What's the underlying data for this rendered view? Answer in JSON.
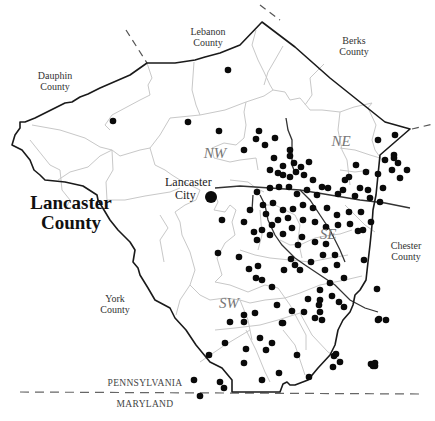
{
  "map": {
    "title_line1": "Lancaster",
    "title_line2": "County",
    "neighbors": {
      "lebanon": [
        "Lebanon",
        "County"
      ],
      "berks": [
        "Berks",
        "County"
      ],
      "dauphin": [
        "Dauphin",
        "County"
      ],
      "chester": [
        "Chester",
        "County"
      ],
      "york": [
        "York",
        "County"
      ]
    },
    "regions": {
      "nw": "NW",
      "ne": "NE",
      "se": "SE",
      "sw": "SW"
    },
    "city": {
      "line1": "Lancaster",
      "line2": "City",
      "x": 211,
      "y": 197
    },
    "states": {
      "north": "PENNSYLVANIA",
      "south": "MARYLAND"
    },
    "colors": {
      "county_border": "#1a1a1a",
      "township_lines": "#c8c8c8",
      "dots": "#0a0a0a",
      "region_labels": "#777777"
    },
    "dots": [
      [
        228,
        70
      ],
      [
        113,
        121
      ],
      [
        188,
        122
      ],
      [
        219,
        131
      ],
      [
        259,
        131
      ],
      [
        256,
        139
      ],
      [
        244,
        150
      ],
      [
        265,
        145
      ],
      [
        275,
        138
      ],
      [
        290,
        150
      ],
      [
        283,
        166
      ],
      [
        290,
        156
      ],
      [
        294,
        163
      ],
      [
        296,
        172
      ],
      [
        274,
        158
      ],
      [
        270,
        170
      ],
      [
        278,
        173
      ],
      [
        283,
        175
      ],
      [
        290,
        177
      ],
      [
        301,
        167
      ],
      [
        309,
        162
      ],
      [
        304,
        175
      ],
      [
        313,
        180
      ],
      [
        322,
        187
      ],
      [
        349,
        177
      ],
      [
        343,
        190
      ],
      [
        360,
        188
      ],
      [
        378,
        140
      ],
      [
        395,
        135
      ],
      [
        394,
        155
      ],
      [
        392,
        170
      ],
      [
        385,
        160
      ],
      [
        378,
        174
      ],
      [
        366,
        172
      ],
      [
        356,
        165
      ],
      [
        345,
        180
      ],
      [
        368,
        190
      ],
      [
        383,
        188
      ],
      [
        380,
        202
      ],
      [
        394,
        158
      ],
      [
        398,
        163
      ],
      [
        407,
        170
      ],
      [
        400,
        178
      ],
      [
        370,
        198
      ],
      [
        355,
        196
      ],
      [
        338,
        194
      ],
      [
        328,
        188
      ],
      [
        317,
        195
      ],
      [
        307,
        190
      ],
      [
        297,
        194
      ],
      [
        289,
        187
      ],
      [
        279,
        187
      ],
      [
        270,
        188
      ],
      [
        257,
        192
      ],
      [
        263,
        205
      ],
      [
        273,
        203
      ],
      [
        283,
        210
      ],
      [
        293,
        209
      ],
      [
        303,
        205
      ],
      [
        313,
        208
      ],
      [
        327,
        208
      ],
      [
        337,
        215
      ],
      [
        349,
        212
      ],
      [
        361,
        212
      ],
      [
        371,
        222
      ],
      [
        363,
        230
      ],
      [
        350,
        224
      ],
      [
        338,
        225
      ],
      [
        326,
        227
      ],
      [
        315,
        222
      ],
      [
        303,
        220
      ],
      [
        288,
        218
      ],
      [
        278,
        220
      ],
      [
        266,
        214
      ],
      [
        272,
        225
      ],
      [
        262,
        230
      ],
      [
        254,
        232
      ],
      [
        244,
        222
      ],
      [
        250,
        210
      ],
      [
        222,
        220
      ],
      [
        218,
        253
      ],
      [
        239,
        257
      ],
      [
        257,
        240
      ],
      [
        270,
        235
      ],
      [
        283,
        234
      ],
      [
        292,
        228
      ],
      [
        298,
        245
      ],
      [
        302,
        237
      ],
      [
        315,
        242
      ],
      [
        326,
        244
      ],
      [
        323,
        255
      ],
      [
        335,
        255
      ],
      [
        337,
        265
      ],
      [
        344,
        278
      ],
      [
        330,
        283
      ],
      [
        320,
        290
      ],
      [
        332,
        296
      ],
      [
        320,
        300
      ],
      [
        308,
        299
      ],
      [
        319,
        305
      ],
      [
        320,
        312
      ],
      [
        322,
        320
      ],
      [
        315,
        318
      ],
      [
        304,
        312
      ],
      [
        292,
        311
      ],
      [
        277,
        305
      ],
      [
        272,
        287
      ],
      [
        262,
        280
      ],
      [
        258,
        266
      ],
      [
        249,
        269
      ],
      [
        256,
        278
      ],
      [
        284,
        270
      ],
      [
        300,
        270
      ],
      [
        311,
        262
      ],
      [
        291,
        259
      ],
      [
        325,
        270
      ],
      [
        339,
        302
      ],
      [
        344,
        307
      ],
      [
        358,
        231
      ],
      [
        364,
        260
      ],
      [
        377,
        289
      ],
      [
        378,
        320
      ],
      [
        386,
        320
      ],
      [
        295,
        265
      ],
      [
        244,
        315
      ],
      [
        255,
        313
      ],
      [
        244,
        322
      ],
      [
        225,
        343
      ],
      [
        230,
        322
      ],
      [
        282,
        323
      ],
      [
        283,
        323
      ],
      [
        209,
        355
      ],
      [
        244,
        363
      ],
      [
        262,
        380
      ],
      [
        279,
        373
      ],
      [
        309,
        377
      ],
      [
        334,
        356
      ],
      [
        340,
        362
      ],
      [
        371,
        364
      ],
      [
        379,
        319
      ],
      [
        272,
        343
      ],
      [
        297,
        355
      ],
      [
        224,
        388
      ],
      [
        246,
        349
      ],
      [
        220,
        382
      ],
      [
        200,
        396
      ],
      [
        194,
        380
      ],
      [
        260,
        338
      ],
      [
        266,
        350
      ],
      [
        333,
        367
      ],
      [
        375,
        366
      ],
      [
        375,
        363
      ],
      [
        336,
        354
      ],
      [
        373,
        366
      ]
    ]
  }
}
